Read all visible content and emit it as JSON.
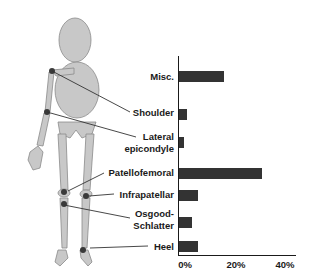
{
  "chart_data": {
    "type": "bar",
    "orientation": "horizontal",
    "title": "",
    "xlabel": "",
    "ylabel": "",
    "categories": [
      "Misc.",
      "Shoulder",
      "Lateral epicondyle",
      "Patellofemoral",
      "Infrapatellar",
      "Osgood-Schlatter",
      "Heel"
    ],
    "values": [
      17,
      3,
      2,
      31,
      7,
      5,
      7
    ],
    "unit": "%",
    "xlim": [
      0,
      40
    ],
    "xticks": [
      "0%",
      "20%",
      "40%"
    ],
    "grid": false,
    "legend": null,
    "bar_color": "#333333",
    "annotation": "Skeleton figure with leader lines from each label to the anatomical site"
  },
  "labels": {
    "misc": "Misc.",
    "shoulder": "Shoulder",
    "lateral1": "Lateral",
    "lateral2": "epicondyle",
    "patellofemoral": "Patellofemoral",
    "infrapatellar": "Infrapatellar",
    "osgood1": "Osgood-",
    "osgood2": "Schlatter",
    "heel": "Heel"
  },
  "ticks": {
    "t0": "0%",
    "t20": "20%",
    "t40": "40%"
  },
  "colors": {
    "figure_fill": "#c8c8c8",
    "figure_stroke": "#8a8a8a",
    "site_marker": "#3a3a3a",
    "leader": "#333333"
  }
}
